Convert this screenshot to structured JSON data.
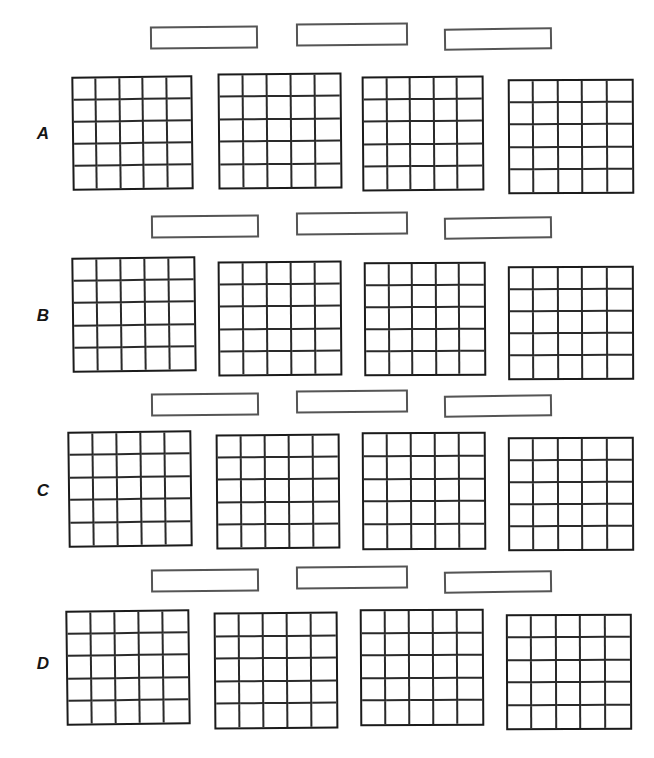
{
  "page": {
    "background_color": "#ffffff",
    "width": 654,
    "height": 758,
    "grid_line_color": "#2a2a2a",
    "box_border_color": "#555555",
    "label_color": "#161616"
  },
  "form": {
    "grid_rows": 5,
    "grid_cols": 5,
    "grids_per_row": 4,
    "caption_boxes_per_row": 3,
    "rows": [
      {
        "label": "A",
        "label_x": 30,
        "label_y": 124,
        "caption_boxes": [
          {
            "text": "",
            "x": 150,
            "y": 26,
            "w": 108,
            "h": 23,
            "rot": -0.6
          },
          {
            "text": "",
            "x": 296,
            "y": 23,
            "w": 112,
            "h": 23,
            "rot": -0.5
          },
          {
            "text": "",
            "x": 444,
            "y": 28,
            "w": 108,
            "h": 22,
            "rot": -0.8
          }
        ],
        "grids": [
          {
            "x": 72,
            "y": 76,
            "w": 121,
            "h": 114,
            "rot": -0.7
          },
          {
            "x": 218,
            "y": 73,
            "w": 124,
            "h": 116,
            "rot": -0.5
          },
          {
            "x": 362,
            "y": 76,
            "w": 122,
            "h": 115,
            "rot": -0.4
          },
          {
            "x": 508,
            "y": 79,
            "w": 126,
            "h": 115,
            "rot": -0.3
          }
        ]
      },
      {
        "label": "B",
        "label_x": 30,
        "label_y": 306,
        "caption_boxes": [
          {
            "text": "",
            "x": 151,
            "y": 215,
            "w": 108,
            "h": 23,
            "rot": -0.6
          },
          {
            "text": "",
            "x": 296,
            "y": 212,
            "w": 112,
            "h": 23,
            "rot": -0.5
          },
          {
            "text": "",
            "x": 444,
            "y": 217,
            "w": 108,
            "h": 22,
            "rot": -0.8
          }
        ],
        "grids": [
          {
            "x": 72,
            "y": 257,
            "w": 124,
            "h": 115,
            "rot": -0.7
          },
          {
            "x": 218,
            "y": 261,
            "w": 124,
            "h": 115,
            "rot": -0.4
          },
          {
            "x": 364,
            "y": 262,
            "w": 122,
            "h": 114,
            "rot": -0.3
          },
          {
            "x": 508,
            "y": 266,
            "w": 126,
            "h": 114,
            "rot": -0.2
          }
        ]
      },
      {
        "label": "C",
        "label_x": 30,
        "label_y": 481,
        "caption_boxes": [
          {
            "text": "",
            "x": 151,
            "y": 393,
            "w": 108,
            "h": 23,
            "rot": -0.6
          },
          {
            "text": "",
            "x": 296,
            "y": 390,
            "w": 112,
            "h": 23,
            "rot": -0.5
          },
          {
            "text": "",
            "x": 444,
            "y": 395,
            "w": 108,
            "h": 22,
            "rot": -0.8
          }
        ],
        "grids": [
          {
            "x": 68,
            "y": 431,
            "w": 124,
            "h": 116,
            "rot": -0.7
          },
          {
            "x": 216,
            "y": 434,
            "w": 124,
            "h": 115,
            "rot": -0.4
          },
          {
            "x": 362,
            "y": 432,
            "w": 124,
            "h": 118,
            "rot": -0.3
          },
          {
            "x": 508,
            "y": 437,
            "w": 126,
            "h": 114,
            "rot": -0.2
          }
        ]
      },
      {
        "label": "D",
        "label_x": 30,
        "label_y": 654,
        "caption_boxes": [
          {
            "text": "",
            "x": 151,
            "y": 569,
            "w": 108,
            "h": 23,
            "rot": -0.6
          },
          {
            "text": "",
            "x": 296,
            "y": 566,
            "w": 112,
            "h": 23,
            "rot": -0.5
          },
          {
            "text": "",
            "x": 444,
            "y": 571,
            "w": 108,
            "h": 22,
            "rot": -0.8
          }
        ],
        "grids": [
          {
            "x": 66,
            "y": 610,
            "w": 124,
            "h": 115,
            "rot": -0.7
          },
          {
            "x": 214,
            "y": 612,
            "w": 124,
            "h": 117,
            "rot": -0.4
          },
          {
            "x": 360,
            "y": 609,
            "w": 124,
            "h": 117,
            "rot": -0.3
          },
          {
            "x": 506,
            "y": 614,
            "w": 126,
            "h": 116,
            "rot": -0.2
          }
        ]
      }
    ]
  }
}
